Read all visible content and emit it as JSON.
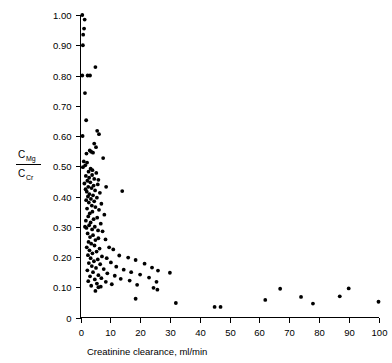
{
  "chart_data": {
    "type": "scatter",
    "title": "",
    "subtitle": "",
    "xlabel": "Creatinine clearance, ml/min",
    "ylabel": "C_Mg / C_Cr",
    "ylabel_numerator": "C",
    "ylabel_numerator_sub": "Mg",
    "ylabel_denominator": "C",
    "ylabel_denominator_sub": "Cr",
    "xlim": [
      0,
      100
    ],
    "ylim": [
      0,
      1.0
    ],
    "grid": false,
    "legend": null,
    "legend_position": "none",
    "xticks": [
      0,
      10,
      20,
      30,
      40,
      50,
      60,
      70,
      80,
      90,
      100
    ],
    "xtick_labels": [
      "0",
      "10",
      "20",
      "30",
      "40",
      "50",
      "60",
      "70",
      "80",
      "90",
      "100"
    ],
    "yticks": [
      0,
      0.1,
      0.2,
      0.3,
      0.4,
      0.5,
      0.6,
      0.7,
      0.8,
      0.9,
      1.0
    ],
    "ytick_labels": [
      "0",
      "0.10",
      "0.20",
      "0.30",
      "0.40",
      "0.50",
      "0.60",
      "0.70",
      "0.80",
      "0.90",
      "1.00"
    ],
    "marker": "filled-circle",
    "marker_color": "#000000",
    "marker_size_px": 3.0,
    "series": [
      {
        "name": "patients",
        "points": [
          [
            0.6,
            1.0
          ],
          [
            1.4,
            0.985
          ],
          [
            1.2,
            0.955
          ],
          [
            0.9,
            0.935
          ],
          [
            0.8,
            0.9
          ],
          [
            5.0,
            0.828
          ],
          [
            0.6,
            0.8
          ],
          [
            2.4,
            0.8
          ],
          [
            3.2,
            0.8
          ],
          [
            1.5,
            0.742
          ],
          [
            1.9,
            0.652
          ],
          [
            0.7,
            0.6
          ],
          [
            5.6,
            0.617
          ],
          [
            6.2,
            0.606
          ],
          [
            4.6,
            0.575
          ],
          [
            5.2,
            0.563
          ],
          [
            3.1,
            0.552
          ],
          [
            3.6,
            0.548
          ],
          [
            4.2,
            0.545
          ],
          [
            2.0,
            0.542
          ],
          [
            7.6,
            0.527
          ],
          [
            1.1,
            0.516
          ],
          [
            2.2,
            0.512
          ],
          [
            1.6,
            0.503
          ],
          [
            0.8,
            0.497
          ],
          [
            3.4,
            0.492
          ],
          [
            4.0,
            0.487
          ],
          [
            2.7,
            0.482
          ],
          [
            5.3,
            0.478
          ],
          [
            3.9,
            0.471
          ],
          [
            1.8,
            0.468
          ],
          [
            2.9,
            0.462
          ],
          [
            4.6,
            0.458
          ],
          [
            6.0,
            0.455
          ],
          [
            2.3,
            0.452
          ],
          [
            3.3,
            0.447
          ],
          [
            1.3,
            0.443
          ],
          [
            5.8,
            0.44
          ],
          [
            4.4,
            0.436
          ],
          [
            2.6,
            0.432
          ],
          [
            3.7,
            0.428
          ],
          [
            8.6,
            0.432
          ],
          [
            1.7,
            0.424
          ],
          [
            4.9,
            0.42
          ],
          [
            2.1,
            0.416
          ],
          [
            6.5,
            0.412
          ],
          [
            3.0,
            0.408
          ],
          [
            14.0,
            0.418
          ],
          [
            4.2,
            0.404
          ],
          [
            2.5,
            0.4
          ],
          [
            5.5,
            0.396
          ],
          [
            3.5,
            0.392
          ],
          [
            1.9,
            0.388
          ],
          [
            4.6,
            0.384
          ],
          [
            2.8,
            0.38
          ],
          [
            7.0,
            0.376
          ],
          [
            3.8,
            0.37
          ],
          [
            5.0,
            0.365
          ],
          [
            2.2,
            0.36
          ],
          [
            6.2,
            0.356
          ],
          [
            4.0,
            0.35
          ],
          [
            3.1,
            0.344
          ],
          [
            8.0,
            0.34
          ],
          [
            2.6,
            0.334
          ],
          [
            5.6,
            0.33
          ],
          [
            4.4,
            0.325
          ],
          [
            1.8,
            0.32
          ],
          [
            3.4,
            0.314
          ],
          [
            6.8,
            0.31
          ],
          [
            2.9,
            0.305
          ],
          [
            4.8,
            0.3
          ],
          [
            2.0,
            0.296
          ],
          [
            3.9,
            0.291
          ],
          [
            5.9,
            0.288
          ],
          [
            1.5,
            0.3
          ],
          [
            7.4,
            0.285
          ],
          [
            2.4,
            0.278
          ],
          [
            4.2,
            0.272
          ],
          [
            3.2,
            0.266
          ],
          [
            6.0,
            0.262
          ],
          [
            5.0,
            0.256
          ],
          [
            2.7,
            0.25
          ],
          [
            8.4,
            0.258
          ],
          [
            3.6,
            0.244
          ],
          [
            4.7,
            0.238
          ],
          [
            2.1,
            0.232
          ],
          [
            6.4,
            0.228
          ],
          [
            3.0,
            0.222
          ],
          [
            5.4,
            0.218
          ],
          [
            9.6,
            0.232
          ],
          [
            11.0,
            0.225
          ],
          [
            4.0,
            0.212
          ],
          [
            2.5,
            0.206
          ],
          [
            7.2,
            0.202
          ],
          [
            3.4,
            0.196
          ],
          [
            5.8,
            0.192
          ],
          [
            8.8,
            0.196
          ],
          [
            13.0,
            0.205
          ],
          [
            16.0,
            0.198
          ],
          [
            4.5,
            0.186
          ],
          [
            2.8,
            0.18
          ],
          [
            6.6,
            0.176
          ],
          [
            10.2,
            0.182
          ],
          [
            3.8,
            0.17
          ],
          [
            18.5,
            0.19
          ],
          [
            21.5,
            0.178
          ],
          [
            5.2,
            0.164
          ],
          [
            12.0,
            0.168
          ],
          [
            7.8,
            0.16
          ],
          [
            2.3,
            0.156
          ],
          [
            14.5,
            0.158
          ],
          [
            24.0,
            0.165
          ],
          [
            4.2,
            0.15
          ],
          [
            9.0,
            0.146
          ],
          [
            17.0,
            0.15
          ],
          [
            26.0,
            0.155
          ],
          [
            6.0,
            0.14
          ],
          [
            3.2,
            0.136
          ],
          [
            11.5,
            0.138
          ],
          [
            20.0,
            0.142
          ],
          [
            30.0,
            0.148
          ],
          [
            7.0,
            0.13
          ],
          [
            4.8,
            0.126
          ],
          [
            13.5,
            0.128
          ],
          [
            23.0,
            0.132
          ],
          [
            2.6,
            0.12
          ],
          [
            8.5,
            0.118
          ],
          [
            16.5,
            0.122
          ],
          [
            5.5,
            0.112
          ],
          [
            10.5,
            0.11
          ],
          [
            25.5,
            0.118
          ],
          [
            3.6,
            0.105
          ],
          [
            6.8,
            0.102
          ],
          [
            19.0,
            0.108
          ],
          [
            24.5,
            0.098
          ],
          [
            25.8,
            0.092
          ],
          [
            5.0,
            0.088
          ],
          [
            6.0,
            0.1
          ],
          [
            67.0,
            0.095
          ],
          [
            90.0,
            0.096
          ],
          [
            18.5,
            0.062
          ],
          [
            32.0,
            0.048
          ],
          [
            45.0,
            0.035
          ],
          [
            47.0,
            0.035
          ],
          [
            62.0,
            0.058
          ],
          [
            74.0,
            0.068
          ],
          [
            78.0,
            0.046
          ],
          [
            87.0,
            0.07
          ],
          [
            100.0,
            0.052
          ]
        ]
      }
    ]
  }
}
